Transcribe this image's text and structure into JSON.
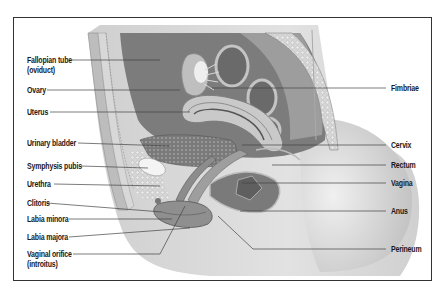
{
  "diagram": {
    "left_labels": [
      {
        "line1": "Fallopian tube",
        "line2": "(oviduct)",
        "y": 60
      },
      {
        "line1": "Ovary",
        "line2": "",
        "y": 90
      },
      {
        "line1": "Uterus",
        "line2": "",
        "y": 112
      },
      {
        "line1": "Urinary bladder",
        "line2": "",
        "y": 143
      },
      {
        "line1": "Symphysis pubis",
        "line2": "",
        "y": 166
      },
      {
        "line1": "Urethra",
        "line2": "",
        "y": 184
      },
      {
        "line1": "Clitoris",
        "line2": "",
        "y": 203
      },
      {
        "line1": "Labia minora",
        "line2": "",
        "y": 219
      },
      {
        "line1": "Labia majora",
        "line2": "",
        "y": 237
      },
      {
        "line1": "Vaginal orifice",
        "line2": "(introitus)",
        "y": 254
      }
    ],
    "right_labels": [
      {
        "text": "Fimbriae",
        "y": 88
      },
      {
        "text": "Cervix",
        "y": 145
      },
      {
        "text": "Rectum",
        "y": 165
      },
      {
        "text": "Vagina",
        "y": 183
      },
      {
        "text": "Anus",
        "y": 211
      },
      {
        "text": "Perineum",
        "y": 249
      }
    ],
    "colors": {
      "frame": "#333333",
      "leader_line": "#444444",
      "tissue_dark": "#6e6e6e",
      "tissue_mid": "#9a9a9a",
      "tissue_light": "#c8c8c8",
      "skin": "#d9d9d9"
    }
  }
}
